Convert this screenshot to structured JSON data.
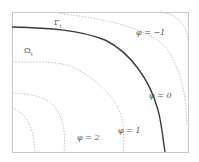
{
  "diagram": {
    "labels": {
      "interface": "Γ_t",
      "interface_main": "Γ",
      "interface_sub": "t",
      "domain": "Ω_t",
      "domain_main": "Ω",
      "domain_sub": "t",
      "level_m1": "φ = −1",
      "level_0": "φ = 0",
      "level_1": "φ = 1",
      "level_2": "φ = 2"
    },
    "colors": {
      "interface_line": "#3a3a3a",
      "level_lines": "#b0b0b0",
      "frame": "#c8c8c8",
      "text": "#555555"
    }
  }
}
